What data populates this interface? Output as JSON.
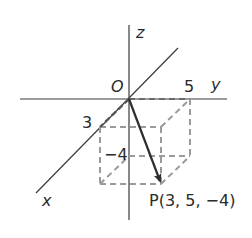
{
  "diagram": {
    "type": "3d-coordinate-axes",
    "axes": {
      "x_label": "x",
      "y_label": "y",
      "z_label": "z",
      "origin_label": "O"
    },
    "ticks": {
      "x_tick": "3",
      "y_tick": "5",
      "z_tick": "−4"
    },
    "point": {
      "label": "P(3, 5, −4)",
      "coordinates": [
        3,
        5,
        -4
      ]
    },
    "colors": {
      "axis": "#3a3a3a",
      "dashed_box": "#9a9a9a",
      "arrow": "#2e2e2e",
      "text": "#2a2a2a"
    }
  }
}
